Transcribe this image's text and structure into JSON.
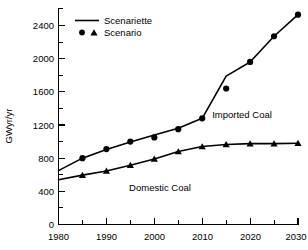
{
  "chart_data": {
    "type": "line",
    "title": "",
    "subtitle": "",
    "xlabel": "",
    "ylabel": "GWyr/yr",
    "xlim": [
      1980,
      2030
    ],
    "ylim": [
      0,
      2600
    ],
    "x_ticks_major": [
      1980,
      1990,
      2000,
      2010,
      2020,
      2030
    ],
    "x_ticks_minor": [
      1985,
      1995,
      2005,
      2015,
      2025
    ],
    "x_tick_labels": [
      "1980",
      "1990",
      "2000",
      "2010",
      "2020",
      "2030"
    ],
    "y_ticks_major": [
      0,
      400,
      800,
      1200,
      1600,
      2000,
      2400
    ],
    "y_ticks_minor": [
      200,
      600,
      1000,
      1400,
      1800,
      2200,
      2600
    ],
    "y_tick_labels": [
      "0",
      "400",
      "800",
      "1200",
      "1600",
      "2000",
      "2400"
    ],
    "grid": false,
    "legend_position": "top-left-inside",
    "legend": [
      {
        "marker": "line",
        "label": "Scenariette"
      },
      {
        "marker": "circle-triangle",
        "label": "Scenario"
      }
    ],
    "annotations": [
      {
        "text": "Imported Coal",
        "x": 2018,
        "y": 1380
      },
      {
        "text": "Domestic Coal",
        "x": 2001,
        "y": 440
      }
    ],
    "x": [
      1980,
      1985,
      1990,
      1995,
      2000,
      2005,
      2010,
      2015,
      2020,
      2025,
      2030
    ],
    "series": [
      {
        "name": "Imported Coal",
        "marker": "circle",
        "line_values": [
          650,
          800,
          905,
          995,
          1080,
          1160,
          1280,
          1790,
          1960,
          2270,
          2530
        ],
        "values": [
          650,
          800,
          910,
          1000,
          1050,
          1150,
          1280,
          1640,
          1960,
          2270,
          2530
        ],
        "marker_x": [
          1985,
          1990,
          1995,
          2000,
          2005,
          2010,
          2015,
          2020,
          2025,
          2030
        ],
        "marker_y": [
          800,
          910,
          1000,
          1050,
          1150,
          1280,
          1640,
          1960,
          2270,
          2530
        ]
      },
      {
        "name": "Domestic Coal",
        "marker": "triangle",
        "line_values": [
          540,
          595,
          645,
          715,
          790,
          880,
          940,
          965,
          975,
          975,
          980
        ],
        "values": [
          540,
          595,
          645,
          715,
          790,
          880,
          940,
          965,
          975,
          975,
          980
        ],
        "marker_x": [
          1985,
          1990,
          1995,
          2000,
          2005,
          2010,
          2015,
          2020,
          2025,
          2030
        ],
        "marker_y": [
          595,
          645,
          715,
          790,
          880,
          940,
          965,
          975,
          975,
          980
        ]
      }
    ]
  },
  "chart": {
    "ylabel": "GWyr/yr",
    "legend": {
      "scenariette_label": "Scenariette",
      "scenario_label": "Scenario"
    },
    "annotations": {
      "imported": "Imported Coal",
      "domestic": "Domestic Coal"
    },
    "x_labels": {
      "t0": "1980",
      "t1": "1990",
      "t2": "2000",
      "t3": "2010",
      "t4": "2020",
      "t5": "2030"
    },
    "y_labels": {
      "v0": "0",
      "v1": "400",
      "v2": "800",
      "v3": "1200",
      "v4": "1600",
      "v5": "2000",
      "v6": "2400"
    },
    "colors": {
      "foreground": "#000000",
      "background": "#ffffff"
    }
  }
}
